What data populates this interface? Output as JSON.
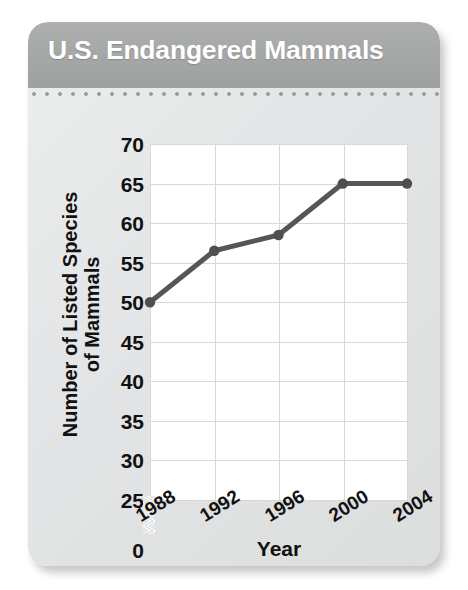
{
  "card": {
    "title": "U.S. Endangered Mammals",
    "header_color": "#a5a6a6",
    "body_color": "#e6e7e7"
  },
  "chart_data": {
    "type": "line",
    "title": "U.S. Endangered Mammals",
    "xlabel": "Year",
    "ylabel": "Number of Listed Species of Mammals",
    "ylabel_lines": [
      "Number of Listed Species",
      "of Mammals"
    ],
    "categories": [
      "1988",
      "1992",
      "1996",
      "2000",
      "2004"
    ],
    "x": [
      1988,
      1992,
      1996,
      2000,
      2004
    ],
    "values": [
      50,
      56.5,
      58.5,
      65,
      65
    ],
    "series": [
      {
        "name": "Listed mammal species",
        "values": [
          50,
          56.5,
          58.5,
          65,
          65
        ]
      }
    ],
    "ylim": [
      25,
      70
    ],
    "yticks": [
      25,
      30,
      35,
      40,
      45,
      50,
      55,
      60,
      65,
      70
    ],
    "ytick_labels": [
      "25",
      "30",
      "35",
      "40",
      "45",
      "50",
      "55",
      "60",
      "65",
      "70"
    ],
    "y_zero_label": "0",
    "axis_break": true,
    "axis_break_between": [
      0,
      25
    ],
    "xtick_labels": [
      "1988",
      "1992",
      "1996",
      "2000",
      "2004"
    ],
    "xtick_rotation": -32,
    "grid": true,
    "legend": null,
    "line_color": "#565656",
    "marker_color": "#4f4f4f",
    "grid_color": "#d8d8d8",
    "plot_background": "#ffffff"
  }
}
